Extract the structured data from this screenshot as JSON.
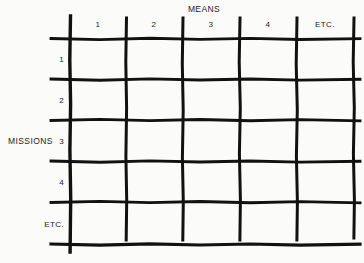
{
  "diagram": {
    "type": "matrix-grid",
    "column_axis_title": "MEANS",
    "row_axis_title": "MISSIONS",
    "column_headers": [
      "1",
      "2",
      "3",
      "4",
      "ETC."
    ],
    "row_headers": [
      "1",
      "2",
      "3",
      "4",
      "ETC."
    ],
    "cells_empty": true,
    "colors": {
      "background": "#fbfbfa",
      "line": "#111111",
      "text": "#1a1a1a"
    },
    "geometry": {
      "vertical_lines_x": [
        70,
        126,
        183,
        240,
        297,
        354
      ],
      "horizontal_lines_y": [
        38,
        79,
        120,
        161,
        202,
        244
      ],
      "axis_top_y": 16,
      "axis_bottom_y": 252
    }
  }
}
